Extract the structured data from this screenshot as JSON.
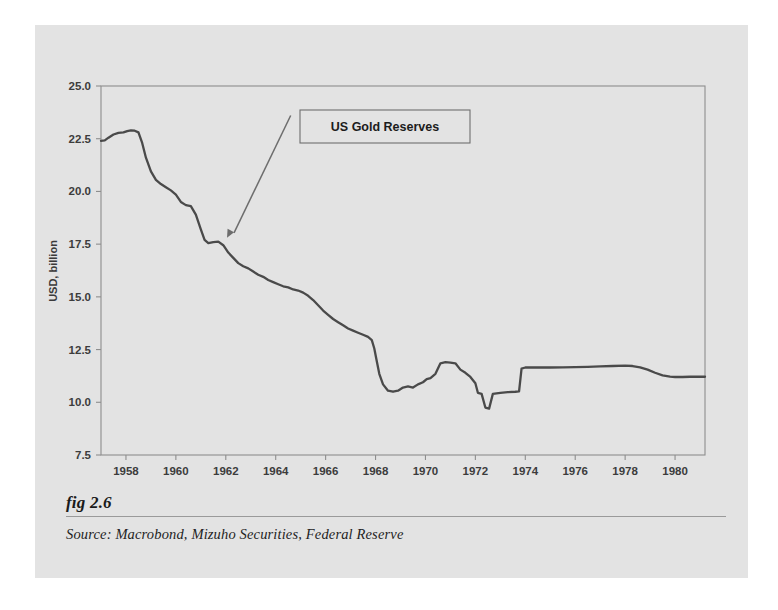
{
  "figure": {
    "number_label": "fig 2.6",
    "source_line": "Source:  Macrobond, Mizuho Securities, Federal Reserve",
    "panel_color": "#e3e3e3",
    "page_color": "#ffffff"
  },
  "chart_data": {
    "type": "line",
    "title": "",
    "xlabel": "",
    "ylabel": "USD, billion",
    "annotation": "US Gold Reserves",
    "line_color": "#4a4a4a",
    "grid": false,
    "legend_position": "none",
    "xlim": [
      1957.0,
      1981.2
    ],
    "ylim": [
      7.5,
      25.0
    ],
    "ytick_labels": [
      "25.0",
      "22.5",
      "20.0",
      "17.5",
      "15.0",
      "12.5",
      "10.0",
      "7.5"
    ],
    "ytick_values": [
      25.0,
      22.5,
      20.0,
      17.5,
      15.0,
      12.5,
      10.0,
      7.5
    ],
    "xtick_labels": [
      "1958",
      "1960",
      "1962",
      "1964",
      "1966",
      "1968",
      "1970",
      "1972",
      "1974",
      "1976",
      "1978",
      "1980"
    ],
    "xtick_values": [
      1958,
      1960,
      1962,
      1964,
      1966,
      1968,
      1970,
      1972,
      1974,
      1976,
      1978,
      1980
    ],
    "series": [
      {
        "name": "US Gold Reserves",
        "x": [
          1957.0,
          1957.15,
          1957.3,
          1957.5,
          1957.7,
          1957.9,
          1958.05,
          1958.2,
          1958.35,
          1958.5,
          1958.65,
          1958.8,
          1959.0,
          1959.2,
          1959.4,
          1959.6,
          1959.8,
          1960.0,
          1960.2,
          1960.4,
          1960.6,
          1960.8,
          1961.0,
          1961.15,
          1961.3,
          1961.5,
          1961.7,
          1961.9,
          1962.1,
          1962.3,
          1962.5,
          1962.7,
          1962.9,
          1963.1,
          1963.3,
          1963.5,
          1963.7,
          1963.9,
          1964.1,
          1964.3,
          1964.5,
          1964.7,
          1964.9,
          1965.1,
          1965.3,
          1965.5,
          1965.7,
          1965.9,
          1966.1,
          1966.3,
          1966.5,
          1966.7,
          1966.9,
          1967.1,
          1967.3,
          1967.5,
          1967.7,
          1967.85,
          1967.95,
          1968.05,
          1968.15,
          1968.3,
          1968.5,
          1968.7,
          1968.9,
          1969.1,
          1969.3,
          1969.5,
          1969.7,
          1969.9,
          1970.05,
          1970.2,
          1970.4,
          1970.6,
          1970.8,
          1971.0,
          1971.2,
          1971.4,
          1971.6,
          1971.8,
          1972.0,
          1972.1,
          1972.25,
          1972.4,
          1972.55,
          1972.7,
          1973.0,
          1973.3,
          1973.6,
          1973.75,
          1973.85,
          1974.0,
          1974.5,
          1975.0,
          1975.5,
          1976.0,
          1976.5,
          1977.0,
          1977.5,
          1978.0,
          1978.3,
          1978.6,
          1978.9,
          1979.2,
          1979.5,
          1979.8,
          1980.0,
          1980.3,
          1980.6,
          1981.0,
          1981.2
        ],
        "y": [
          22.4,
          22.42,
          22.55,
          22.7,
          22.78,
          22.8,
          22.86,
          22.9,
          22.88,
          22.8,
          22.3,
          21.6,
          20.95,
          20.55,
          20.35,
          20.2,
          20.05,
          19.85,
          19.5,
          19.35,
          19.3,
          18.9,
          18.2,
          17.7,
          17.55,
          17.6,
          17.62,
          17.45,
          17.1,
          16.85,
          16.6,
          16.45,
          16.35,
          16.2,
          16.05,
          15.95,
          15.8,
          15.7,
          15.6,
          15.5,
          15.45,
          15.35,
          15.3,
          15.2,
          15.05,
          14.85,
          14.6,
          14.35,
          14.15,
          13.95,
          13.8,
          13.65,
          13.5,
          13.4,
          13.3,
          13.2,
          13.1,
          12.95,
          12.55,
          11.95,
          11.35,
          10.85,
          10.55,
          10.5,
          10.55,
          10.7,
          10.75,
          10.7,
          10.85,
          10.95,
          11.1,
          11.15,
          11.35,
          11.85,
          11.9,
          11.88,
          11.85,
          11.55,
          11.4,
          11.2,
          10.9,
          10.45,
          10.4,
          9.75,
          9.7,
          10.4,
          10.45,
          10.48,
          10.5,
          10.52,
          11.6,
          11.65,
          11.66,
          11.65,
          11.66,
          11.67,
          11.68,
          11.7,
          11.72,
          11.74,
          11.72,
          11.66,
          11.55,
          11.4,
          11.28,
          11.22,
          11.2,
          11.2,
          11.21,
          11.21,
          11.21
        ]
      }
    ],
    "annotation_box": {
      "text": "US Gold Reserves",
      "arrow_from": [
        1964.6,
        23.6
      ],
      "arrow_to": [
        1962.05,
        17.8
      ]
    }
  }
}
